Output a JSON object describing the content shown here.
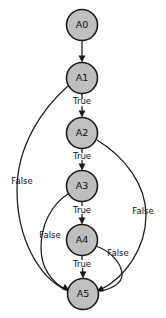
{
  "diagram": {
    "type": "control-flow-graph",
    "title": "",
    "canvas": {
      "width": 166,
      "height": 318,
      "background": "#ffffff"
    },
    "style": {
      "node_fill": "#bfbfbf",
      "node_stroke": "#1a1a1a",
      "edge_stroke": "#1a1a1a",
      "text_color": "#0d0d0d"
    },
    "nodes": [
      {
        "id": "A0",
        "label": "A0",
        "cx": 82,
        "cy": 25,
        "r": 15.5
      },
      {
        "id": "A1",
        "label": "A1",
        "cx": 82,
        "cy": 78,
        "r": 15.5
      },
      {
        "id": "A2",
        "label": "A2",
        "cx": 82,
        "cy": 133,
        "r": 15.5
      },
      {
        "id": "A3",
        "label": "A3",
        "cx": 82,
        "cy": 186,
        "r": 15.5
      },
      {
        "id": "A4",
        "label": "A4",
        "cx": 82,
        "cy": 240,
        "r": 15.5
      },
      {
        "id": "A5",
        "label": "A5",
        "cx": 83,
        "cy": 294,
        "r": 15.5
      }
    ],
    "edges": [
      {
        "id": "e-a0-a1",
        "from": "A0",
        "to": "A1",
        "label": "",
        "path": "M 82 41 L 82 60",
        "head": "82,62.5 78.6,55.5 85.4,55.5"
      },
      {
        "id": "e-a1-a2",
        "from": "A1",
        "to": "A2",
        "label": "True",
        "label_x": 82,
        "label_y": 101,
        "path": "M 82 94 L 82 99 M 82 106 L 82 115",
        "head": "82,117.5 78.6,110.5 85.4,110.5"
      },
      {
        "id": "e-a2-a3",
        "from": "A2",
        "to": "A3",
        "label": "True",
        "label_x": 82,
        "label_y": 156,
        "path": "M 82 149 L 82 153 M 82 160 L 82 168",
        "head": "82,170.5 78.6,163.5 85.4,163.5"
      },
      {
        "id": "e-a3-a4",
        "from": "A3",
        "to": "A4",
        "label": "True",
        "label_x": 82,
        "label_y": 210,
        "path": "M 82 202 L 82 206 M 82 214 L 82 222",
        "head": "82,224.5 78.6,217.5 85.4,217.5"
      },
      {
        "id": "e-a4-a5",
        "from": "A4",
        "to": "A5",
        "label": "True",
        "label_x": 82,
        "label_y": 264,
        "path": "M 82 256 L 82 260 M 82.5 268 L 83 276",
        "head": "83,278.5 79.6,271.5 86.4,271.5"
      },
      {
        "id": "e-a1-a5",
        "from": "A1",
        "to": "A5",
        "label": "False",
        "label_x": 22,
        "label_y": 181,
        "path": "M 68 86 C 43 108, 17 145, 17 190 C 17 240, 40 278, 66 290",
        "head": "69.5,291.5 62.2,289.2 64.7,283.9"
      },
      {
        "id": "e-a2-a5",
        "from": "A2",
        "to": "A5",
        "label": "False",
        "label_x": 143,
        "label_y": 211,
        "path": "M 97 140 C 125 157, 146 185, 146 215 C 146 248, 125 278, 100 290",
        "head": "96.8,291.4 101.8,285.8 104.1,291.2"
      },
      {
        "id": "e-a3-a5",
        "from": "A3",
        "to": "A5",
        "label": "False",
        "label_x": 50,
        "label_y": 235,
        "path": "M 68 194 C 51 205, 41 225, 41 248 C 41 268, 52 283, 67 290",
        "head": "70.2,291.4 63,289.6 65.2,284.2"
      },
      {
        "id": "e-a4-a5",
        "from": "A4",
        "to": "A5",
        "label": "False",
        "label_x": 118,
        "label_y": 253,
        "path": "M 96 246 C 112 252, 122 264, 122 275 C 122 283, 112 289, 100 291",
        "head": "96.6,291.5 101.4,285.7 103.9,291",
        "label_anchor": "start"
      }
    ]
  }
}
